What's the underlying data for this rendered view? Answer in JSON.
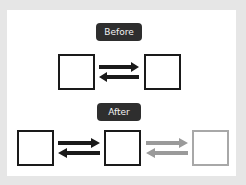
{
  "sections": [
    {
      "label": "Before",
      "boxes": 2
    },
    {
      "label": "After",
      "boxes": 3
    }
  ],
  "colors": {
    "primary": "#1a1a1a",
    "faded": "#a8a8a8",
    "badge_bg": "#2e2e2e"
  }
}
